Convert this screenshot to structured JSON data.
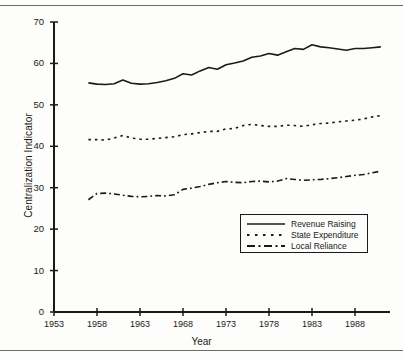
{
  "chart_data": {
    "type": "line",
    "title": "",
    "xlabel": "Year",
    "ylabel": "Centralization Indicator",
    "xlim": [
      1953,
      1992
    ],
    "ylim": [
      0,
      70
    ],
    "xticks": [
      1953,
      1958,
      1963,
      1968,
      1973,
      1978,
      1983,
      1988
    ],
    "yticks": [
      0,
      10,
      20,
      30,
      40,
      50,
      60,
      70
    ],
    "grid": false,
    "legend_position": "inside lower right",
    "x": [
      1957,
      1958,
      1959,
      1960,
      1961,
      1962,
      1963,
      1964,
      1965,
      1966,
      1967,
      1968,
      1969,
      1970,
      1971,
      1972,
      1973,
      1974,
      1975,
      1976,
      1977,
      1978,
      1979,
      1980,
      1981,
      1982,
      1983,
      1984,
      1985,
      1986,
      1987,
      1988,
      1989,
      1990,
      1991
    ],
    "series": [
      {
        "name": "Revenue Raising",
        "style": "solid",
        "color": "#1a1a1a",
        "values": [
          55.3,
          55.0,
          54.9,
          55.1,
          56.0,
          55.2,
          55.0,
          55.1,
          55.4,
          55.8,
          56.4,
          57.5,
          57.2,
          58.2,
          59.0,
          58.6,
          59.7,
          60.1,
          60.6,
          61.5,
          61.8,
          62.4,
          62.0,
          62.8,
          63.6,
          63.4,
          64.5,
          64.0,
          63.8,
          63.5,
          63.2,
          63.6,
          63.6,
          63.8,
          64.0
        ]
      },
      {
        "name": "State Expenditure",
        "style": "dotted",
        "color": "#1a1a1a",
        "values": [
          41.6,
          41.6,
          41.5,
          42.0,
          42.6,
          42.0,
          41.7,
          41.7,
          41.9,
          42.1,
          42.3,
          42.8,
          43.0,
          43.3,
          43.6,
          43.6,
          44.2,
          44.3,
          45.0,
          45.3,
          45.0,
          44.8,
          44.8,
          45.1,
          45.0,
          44.8,
          45.2,
          45.5,
          45.6,
          45.9,
          46.1,
          46.3,
          46.6,
          47.1,
          47.4
        ]
      },
      {
        "name": "Local Reliance",
        "style": "dashdot",
        "color": "#1a1a1a",
        "values": [
          27.1,
          28.6,
          28.7,
          28.5,
          28.2,
          27.9,
          27.8,
          27.9,
          28.1,
          28.0,
          28.3,
          29.6,
          29.9,
          30.3,
          30.8,
          31.2,
          31.5,
          31.3,
          31.2,
          31.5,
          31.6,
          31.4,
          31.6,
          32.2,
          32.0,
          31.8,
          31.9,
          32.0,
          32.2,
          32.4,
          32.7,
          33.0,
          33.2,
          33.6,
          34.0
        ]
      }
    ]
  },
  "axes": {
    "y_label": "Centralization Indicator",
    "x_label": "Year",
    "y_tick_labels": [
      "70",
      "60",
      "50",
      "40",
      "30",
      "20",
      "10",
      "0"
    ],
    "x_tick_labels": [
      "1953",
      "1958",
      "1963",
      "1968",
      "1973",
      "1978",
      "1983",
      "1988"
    ]
  },
  "legend": {
    "items": [
      {
        "label": "Revenue Raising",
        "style": "solid"
      },
      {
        "label": "State Expenditure",
        "style": "dotted"
      },
      {
        "label": "Local Reliance",
        "style": "dashdot"
      }
    ]
  }
}
